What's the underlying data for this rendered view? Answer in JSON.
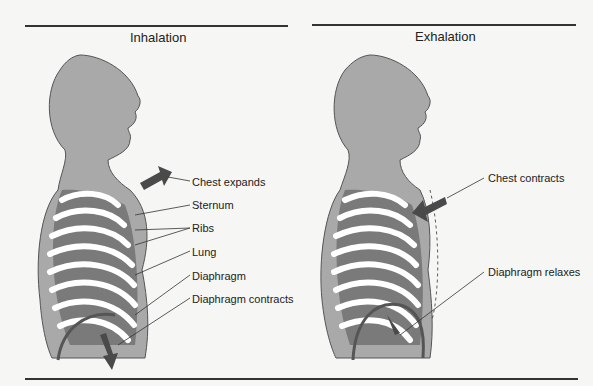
{
  "panels": [
    {
      "title": "Inhalation",
      "labels": [
        "Chest expands",
        "Sternum",
        "Ribs",
        "Lung",
        "Diaphragm",
        "Diaphragm contracts"
      ]
    },
    {
      "title": "Exhalation",
      "labels": [
        "Chest contracts",
        "Diaphragm relaxes"
      ]
    }
  ],
  "colors": {
    "body": "#a9a9a9",
    "lung": "#7a7a7a",
    "rib": "#ffffff",
    "arrow": "#4a4a4a",
    "rule": "#333333"
  }
}
